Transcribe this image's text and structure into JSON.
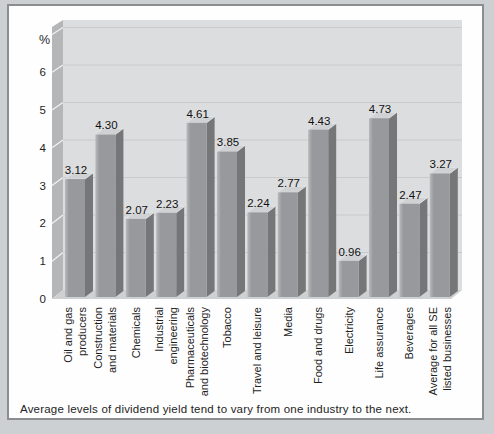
{
  "caption": {
    "text": "Average levels of dividend yield tend to vary from one industry to the next."
  },
  "chart_data": {
    "type": "bar",
    "style": "3d-column-grayscale",
    "title": "",
    "ylabel": "%",
    "xlabel": "",
    "ylim": [
      0,
      7
    ],
    "yticks": [
      0,
      1,
      2,
      3,
      4,
      5,
      6
    ],
    "grid": true,
    "legend": false,
    "categories": [
      "Oil and gas producers",
      "Construction and materials",
      "Chemicals",
      "Industrial engineering",
      "Pharmaceuticals and biotechnology",
      "Tobacco",
      "Travel and leisure",
      "Media",
      "Food and drugs",
      "Electricity",
      "Life assurance",
      "Beverages",
      "Average for all SE listed businesses"
    ],
    "category_label_lines": [
      [
        "Oil and gas",
        "producers"
      ],
      [
        "Construction",
        "and materials"
      ],
      [
        "Chemicals"
      ],
      [
        "Industrial",
        "engineering"
      ],
      [
        "Pharmaceuticals",
        "and biotechnology"
      ],
      [
        "Tobacco"
      ],
      [
        "Travel and leisure"
      ],
      [
        "Media"
      ],
      [
        "Food and drugs"
      ],
      [
        "Electricity"
      ],
      [
        "Life assurance"
      ],
      [
        "Beverages"
      ],
      [
        "Average for all SE",
        "listed businesses"
      ]
    ],
    "values": [
      3.12,
      4.3,
      2.07,
      2.23,
      4.61,
      3.85,
      2.24,
      2.77,
      4.43,
      0.96,
      4.73,
      2.47,
      3.27
    ],
    "value_labels": [
      "3.12",
      "4.30",
      "2.07",
      "2.23",
      "4.61",
      "3.85",
      "2.24",
      "2.77",
      "4.43",
      "0.96",
      "4.73",
      "2.47",
      "3.27"
    ],
    "colors": {
      "outer_background": "#ccd0d2",
      "frame_border": "#8a8e90",
      "inner_background": "#fefefe",
      "wall_back": "#dcddde",
      "wall_side": "#b4b6b8",
      "floor": "#ced0d2",
      "gridline": "#c9cacc",
      "wall_tick": "#f2f3f4",
      "bar_front_light": "#b7b9bb",
      "bar_front": "#97999c",
      "bar_side": "#747678",
      "bar_top": "#cfd1d3",
      "text": "#1f1f1f"
    }
  }
}
